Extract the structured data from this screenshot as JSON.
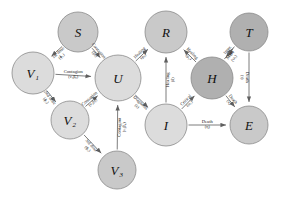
{
  "figure": {
    "title": "",
    "background": "#ffffff",
    "colors": {
      "node_light": "#dcdcdc",
      "node_mid": "#c9c9c9",
      "node_dark": "#b0b0b0",
      "node_stroke": "#8a8a8a",
      "edge": "#6e6e6e",
      "text": "#141414"
    }
  },
  "nodes": [
    {
      "id": "S",
      "label": "S",
      "x": 78,
      "y": 32,
      "r": 20,
      "shade": "node_mid"
    },
    {
      "id": "V1",
      "label": "V",
      "sub": "1",
      "x": 33,
      "y": 73,
      "r": 21,
      "shade": "node_light"
    },
    {
      "id": "V2",
      "label": "V",
      "sub": "2",
      "x": 70,
      "y": 120,
      "r": 19,
      "shade": "node_light"
    },
    {
      "id": "V3",
      "label": "V",
      "sub": "3",
      "x": 117,
      "y": 170,
      "r": 19,
      "shade": "node_mid"
    },
    {
      "id": "U",
      "label": "U",
      "x": 118,
      "y": 78,
      "r": 23,
      "shade": "node_light"
    },
    {
      "id": "R",
      "label": "R",
      "x": 166,
      "y": 32,
      "r": 21,
      "shade": "node_mid"
    },
    {
      "id": "I",
      "label": "I",
      "x": 166,
      "y": 125,
      "r": 21,
      "shade": "node_light"
    },
    {
      "id": "H",
      "label": "H",
      "x": 212,
      "y": 78,
      "r": 21,
      "shade": "node_dark"
    },
    {
      "id": "T",
      "label": "T",
      "x": 249,
      "y": 32,
      "r": 19,
      "shade": "node_dark"
    },
    {
      "id": "E",
      "label": "E",
      "x": 249,
      "y": 125,
      "r": 19,
      "shade": "node_mid"
    }
  ],
  "edges": [
    {
      "from": "S",
      "to": "V1",
      "label": "1st dose",
      "param": "(ɸ₁)",
      "rotated": true
    },
    {
      "from": "S",
      "to": "U",
      "label": "Contagion",
      "param": "(β₀)",
      "rotated": true
    },
    {
      "from": "V1",
      "to": "U",
      "label": "Contagion",
      "param": "(ν₁β₀)",
      "rotated": false
    },
    {
      "from": "V1",
      "to": "V2",
      "label": "2nd dose",
      "param": "(ɸ₂)",
      "rotated": true
    },
    {
      "from": "V2",
      "to": "U",
      "label": "Contagion",
      "param": "(ν₂β₀)",
      "rotated": true
    },
    {
      "from": "V2",
      "to": "V3",
      "label": "3rd dose",
      "param": "(ɸ₃)",
      "rotated": true
    },
    {
      "from": "V3",
      "to": "U",
      "label": "Contagion",
      "param": "(ν₃β₀)",
      "rotated": true
    },
    {
      "from": "U",
      "to": "R",
      "label": "Healing",
      "param": "(μ₀)",
      "rotated": true
    },
    {
      "from": "U",
      "to": "I",
      "label": "Diagnosis",
      "param": "(ε)",
      "rotated": true
    },
    {
      "from": "I",
      "to": "R",
      "label": "Healing",
      "param": "(δ)",
      "rotated": true
    },
    {
      "from": "I",
      "to": "H",
      "label": "Critical",
      "param": "(ω₁)",
      "rotated": true
    },
    {
      "from": "I",
      "to": "E",
      "label": "Death",
      "param": "(η)",
      "rotated": false
    },
    {
      "from": "H",
      "to": "R",
      "label": "Healing",
      "param": "(μ₁)",
      "rotated": true
    },
    {
      "from": "H",
      "to": "T",
      "label": "More",
      "param": "(ω₂)",
      "rotated": true
    },
    {
      "from": "T",
      "to": "H",
      "label": "Impr.",
      "param": "(θ)",
      "rotated": true
    },
    {
      "from": "H",
      "to": "E",
      "label": "Death",
      "param": "(κ)",
      "rotated": true
    },
    {
      "from": "T",
      "to": "E",
      "label": "Death",
      "param": "(τ)",
      "rotated": true
    }
  ]
}
